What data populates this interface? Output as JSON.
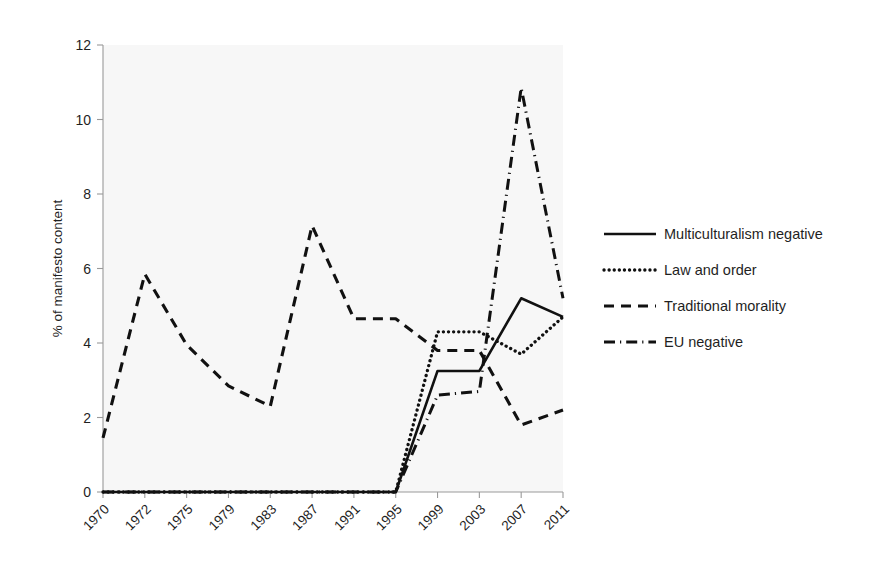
{
  "chart_data": {
    "type": "line",
    "title": "",
    "xlabel": "",
    "ylabel": "% of manifesto content",
    "categories": [
      "1970",
      "1972",
      "1975",
      "1979",
      "1983",
      "1987",
      "1991",
      "1995",
      "1999",
      "2003",
      "2007",
      "2011"
    ],
    "ylim": [
      0,
      12
    ],
    "yticks": [
      0,
      2,
      4,
      6,
      8,
      10,
      12
    ],
    "grid": false,
    "legend_position": "right",
    "series": [
      {
        "name": "Multiculturalism negative",
        "style": "solid",
        "values": [
          0,
          0,
          0,
          0,
          0,
          0,
          0,
          0,
          3.25,
          3.25,
          5.2,
          4.7
        ]
      },
      {
        "name": "Law and order",
        "style": "dotted",
        "values": [
          0,
          0,
          0,
          0,
          0,
          0,
          0,
          0,
          4.3,
          4.3,
          3.7,
          4.7
        ]
      },
      {
        "name": "Traditional morality",
        "style": "dashed",
        "values": [
          1.45,
          5.85,
          3.95,
          2.85,
          2.3,
          7.15,
          4.65,
          4.65,
          3.8,
          3.8,
          1.8,
          2.2
        ]
      },
      {
        "name": "EU negative",
        "style": "dash-dot",
        "values": [
          0,
          0,
          0,
          0,
          0,
          0,
          0,
          0,
          2.6,
          2.7,
          10.85,
          5.2
        ]
      }
    ]
  },
  "legend": {
    "items": [
      {
        "label": "Multiculturalism negative",
        "style": "solid"
      },
      {
        "label": "Law and order",
        "style": "dotted"
      },
      {
        "label": "Traditional morality",
        "style": "dashed"
      },
      {
        "label": "EU negative",
        "style": "dash-dot"
      }
    ]
  }
}
